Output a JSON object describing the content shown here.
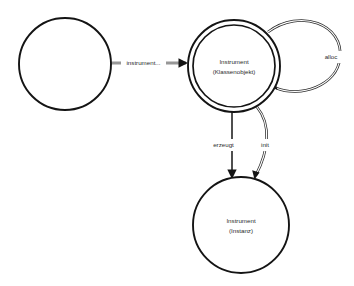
{
  "diagram": {
    "type": "uml-object-interaction-diagram",
    "background_color": "#ffffff",
    "stroke_color": "#141414",
    "text_color": "#2b2b2b",
    "nodes": [
      {
        "id": "client",
        "shape": "circle",
        "style": "single",
        "label_line1": "",
        "label_line2": "",
        "cx": 65,
        "cy": 64,
        "r": 46
      },
      {
        "id": "instrument-class-object",
        "shape": "circle",
        "style": "double",
        "label_line1": "Instrument",
        "label_line2": "(Klassenobjekt)",
        "cx": 234,
        "cy": 66,
        "r": 46,
        "r_inner": 41
      },
      {
        "id": "instrument-instance",
        "shape": "circle",
        "style": "single",
        "label_line1": "Instrument",
        "label_line2": "(Instanz)",
        "cx": 241,
        "cy": 225,
        "r": 48
      }
    ],
    "edges": [
      {
        "id": "instrument-message",
        "label": "instrument...",
        "from": "client",
        "to": "instrument-class-object",
        "line_style": "double",
        "arrowhead": "solid"
      },
      {
        "id": "alloc-self-loop",
        "label": "alloc",
        "from": "instrument-class-object",
        "to": "instrument-class-object",
        "line_style": "double",
        "arrowhead": "solid"
      },
      {
        "id": "erzeugt-edge",
        "label": "erzeugt",
        "from": "instrument-class-object",
        "to": "instrument-instance",
        "line_style": "solid",
        "arrowhead": "solid"
      },
      {
        "id": "init-edge",
        "label": "init",
        "from": "instrument-class-object",
        "to": "instrument-instance",
        "line_style": "double",
        "arrowhead": "solid"
      }
    ]
  }
}
